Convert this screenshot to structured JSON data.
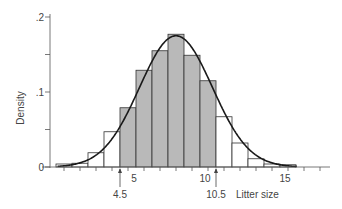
{
  "chart_data": {
    "type": "bar",
    "title": "",
    "xlabel": "Litter size",
    "ylabel": "Density",
    "categories": [
      1,
      2,
      3,
      4,
      5,
      6,
      7,
      8,
      9,
      10,
      11,
      12,
      13,
      14,
      15
    ],
    "values": [
      0.004,
      0.005,
      0.019,
      0.047,
      0.079,
      0.129,
      0.155,
      0.177,
      0.149,
      0.115,
      0.067,
      0.032,
      0.011,
      0.004,
      0.003
    ],
    "shaded_range": [
      4.5,
      10.5
    ],
    "shaded_categories": [
      5,
      6,
      7,
      8,
      9,
      10
    ],
    "overlay_curve": {
      "type": "normal",
      "mean": 8.0,
      "sd": 2.28
    },
    "xlim": [
      0,
      17.5
    ],
    "ylim": [
      0,
      0.2
    ],
    "x_tick_labels": [
      "5",
      "10",
      "15"
    ],
    "x_tick_values": [
      5,
      10,
      15
    ],
    "y_tick_labels": [
      "0",
      ".1",
      ".2"
    ],
    "y_tick_values": [
      0,
      0.1,
      0.2
    ],
    "annotations": [
      {
        "text": "4.5",
        "x": 4.5
      },
      {
        "text": "10.5",
        "x": 10.5
      }
    ],
    "grid": false,
    "colors": {
      "shaded": "#b9b9b9",
      "unshaded": "#ffffff",
      "outline": "#333333",
      "curve": "#1a1a1a"
    }
  }
}
